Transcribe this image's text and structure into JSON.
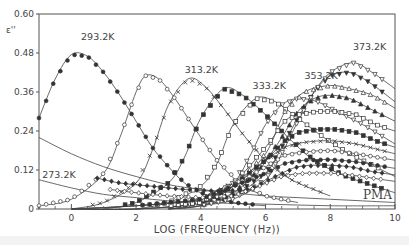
{
  "chart_data": {
    "type": "line",
    "title": "",
    "xlabel": "LOG (FREQUENCY (Hz))",
    "ylabel": "ε''",
    "xlim": [
      -1,
      10
    ],
    "ylim": [
      0,
      0.6
    ],
    "xticks": [
      0,
      2,
      4,
      6,
      8,
      10
    ],
    "xtick_labels": [
      "0",
      "2",
      "4",
      "6",
      "8",
      "10"
    ],
    "yticks": [
      0,
      0.12,
      0.24,
      0.36,
      0.48,
      0.6
    ],
    "ytick_labels": [
      "0",
      "0.12",
      "0.24",
      "0.36",
      "0.48",
      "0.60"
    ],
    "grid": false,
    "legend": "none",
    "annotation_pma": "PMA",
    "curve_labels": [
      {
        "text": "293.2K",
        "x": 0.3,
        "y": 0.52
      },
      {
        "text": "313.2K",
        "x": 3.5,
        "y": 0.42
      },
      {
        "text": "333.2K",
        "x": 5.6,
        "y": 0.37
      },
      {
        "text": "353.2K",
        "x": 7.2,
        "y": 0.4
      },
      {
        "text": "373.2K",
        "x": 8.7,
        "y": 0.49
      },
      {
        "text": "273.2K",
        "x": -0.9,
        "y": 0.095
      }
    ],
    "series": [
      {
        "name": "273.2K",
        "marker": "none",
        "x": [
          -1,
          0,
          1,
          2,
          3,
          4,
          5,
          6,
          7,
          8,
          9,
          10
        ],
        "y": [
          0.22,
          0.17,
          0.13,
          0.1,
          0.075,
          0.06,
          0.05,
          0.04,
          0.035,
          0.03,
          0.025,
          0.02
        ]
      },
      {
        "name": "273.2K-b",
        "marker": "none",
        "x": [
          -1,
          0,
          1,
          2,
          3,
          4,
          6,
          8,
          10
        ],
        "y": [
          0.09,
          0.065,
          0.045,
          0.035,
          0.025,
          0.02,
          0.015,
          0.01,
          0.01
        ]
      },
      {
        "name": "293.2K",
        "marker": "filled-circle",
        "x": [
          -1,
          -0.5,
          0,
          0.5,
          1,
          1.5,
          2,
          2.5,
          3,
          3.5,
          4,
          5,
          6
        ],
        "y": [
          0.28,
          0.4,
          0.475,
          0.47,
          0.42,
          0.35,
          0.27,
          0.19,
          0.13,
          0.08,
          0.05,
          0.02,
          0.01
        ]
      },
      {
        "name": "303.2K",
        "marker": "open-circle-dot",
        "x": [
          -1,
          0,
          1,
          1.5,
          2,
          2.3,
          2.7,
          3.2,
          3.8,
          4.5,
          5.2,
          6,
          7
        ],
        "y": [
          0.01,
          0.03,
          0.11,
          0.22,
          0.36,
          0.41,
          0.4,
          0.34,
          0.25,
          0.15,
          0.08,
          0.04,
          0.02
        ]
      },
      {
        "name": "313.2K",
        "marker": "open-x",
        "x": [
          0,
          1,
          2,
          2.5,
          3,
          3.6,
          4.1,
          4.7,
          5.3,
          6,
          6.8,
          8
        ],
        "y": [
          0.0,
          0.02,
          0.08,
          0.18,
          0.32,
          0.4,
          0.38,
          0.31,
          0.23,
          0.15,
          0.09,
          0.04
        ]
      },
      {
        "name": "323.2K",
        "marker": "filled-square",
        "x": [
          1,
          2,
          3,
          3.5,
          4,
          4.7,
          5.3,
          6,
          6.8,
          7.5,
          8.5,
          10
        ],
        "y": [
          0.0,
          0.02,
          0.08,
          0.16,
          0.28,
          0.37,
          0.35,
          0.29,
          0.21,
          0.15,
          0.1,
          0.05
        ]
      },
      {
        "name": "333.2K",
        "marker": "open-square",
        "x": [
          2,
          3,
          4,
          4.5,
          5,
          5.7,
          6.3,
          7,
          7.8,
          8.6,
          10
        ],
        "y": [
          0.0,
          0.02,
          0.07,
          0.14,
          0.26,
          0.34,
          0.33,
          0.28,
          0.22,
          0.17,
          0.1
        ]
      },
      {
        "name": "343.2K",
        "marker": "open-triangle-down",
        "x": [
          3,
          4,
          5,
          5.5,
          6,
          6.5,
          7,
          7.6,
          8.2,
          9,
          10
        ],
        "y": [
          0.0,
          0.02,
          0.08,
          0.16,
          0.26,
          0.32,
          0.34,
          0.33,
          0.3,
          0.26,
          0.2
        ]
      },
      {
        "name": "353.2K",
        "marker": "filled-triangle-up",
        "x": [
          3,
          4,
          5,
          5.8,
          6.5,
          7,
          7.5,
          8,
          8.6,
          9.2,
          10
        ],
        "y": [
          0.0,
          0.01,
          0.05,
          0.12,
          0.22,
          0.3,
          0.34,
          0.35,
          0.34,
          0.31,
          0.27
        ]
      },
      {
        "name": "363.2K",
        "marker": "filled-triangle-down",
        "x": [
          3,
          4,
          5,
          6,
          6.5,
          7,
          7.5,
          8,
          8.6,
          9.2,
          10
        ],
        "y": [
          0.0,
          0.01,
          0.04,
          0.11,
          0.19,
          0.28,
          0.36,
          0.41,
          0.42,
          0.39,
          0.33
        ]
      },
      {
        "name": "373.2K",
        "marker": "open-triangle-down",
        "x": [
          3,
          4,
          5,
          6,
          6.5,
          7,
          7.5,
          8,
          8.7,
          9.3,
          10
        ],
        "y": [
          0.0,
          0.01,
          0.03,
          0.09,
          0.17,
          0.27,
          0.36,
          0.42,
          0.45,
          0.42,
          0.37
        ]
      },
      {
        "name": "series-open-triangle-up",
        "marker": "open-triangle-up",
        "x": [
          0,
          2,
          4,
          5,
          6,
          6.6,
          7.2,
          8,
          8.6,
          9.3,
          10
        ],
        "y": [
          0.0,
          0.0,
          0.02,
          0.07,
          0.17,
          0.3,
          0.36,
          0.38,
          0.37,
          0.35,
          0.31
        ]
      },
      {
        "name": "series-filled-square-2",
        "marker": "filled-square",
        "x": [
          0,
          2,
          4,
          5,
          6,
          6.6,
          7,
          7.6,
          8.2,
          8.8,
          9.4,
          10
        ],
        "y": [
          0.0,
          0.0,
          0.02,
          0.07,
          0.15,
          0.21,
          0.235,
          0.245,
          0.245,
          0.235,
          0.21,
          0.19
        ]
      },
      {
        "name": "series-open-square-2",
        "marker": "open-square",
        "x": [
          0,
          2,
          4,
          5,
          6,
          6.6,
          7,
          7.6,
          8.2,
          8.8,
          9.4,
          10
        ],
        "y": [
          0.0,
          0.0,
          0.02,
          0.08,
          0.19,
          0.27,
          0.29,
          0.3,
          0.3,
          0.29,
          0.26,
          0.24
        ]
      },
      {
        "name": "series-x",
        "marker": "x",
        "x": [
          0,
          2,
          4,
          5,
          6,
          6.6,
          7.2,
          8,
          8.8,
          9.4,
          10
        ],
        "y": [
          0.0,
          0.01,
          0.03,
          0.08,
          0.15,
          0.19,
          0.205,
          0.21,
          0.2,
          0.185,
          0.17
        ]
      },
      {
        "name": "series-open-circle",
        "marker": "open-circle",
        "x": [
          0,
          2,
          4,
          5,
          6,
          6.6,
          7.2,
          8,
          8.8,
          9.4,
          10
        ],
        "y": [
          0.0,
          0.01,
          0.03,
          0.07,
          0.13,
          0.165,
          0.175,
          0.18,
          0.17,
          0.16,
          0.15
        ]
      },
      {
        "name": "series-filled-circle-2",
        "marker": "filled-circle",
        "x": [
          0,
          2,
          4,
          5,
          6,
          6.6,
          7.2,
          8,
          8.8,
          9.4,
          10
        ],
        "y": [
          0.0,
          0.01,
          0.03,
          0.07,
          0.11,
          0.14,
          0.15,
          0.152,
          0.145,
          0.135,
          0.125
        ]
      },
      {
        "name": "series-filled-diamond",
        "marker": "filled-diamond",
        "x": [
          0.8,
          1.5,
          2.5,
          3.5,
          4.5,
          5.5,
          6.3,
          7,
          7.8,
          8.6,
          9.3,
          10
        ],
        "y": [
          0.095,
          0.08,
          0.07,
          0.06,
          0.055,
          0.06,
          0.1,
          0.13,
          0.135,
          0.13,
          0.115,
          0.105
        ]
      },
      {
        "name": "series-open-diamond",
        "marker": "open-diamond",
        "x": [
          1.2,
          2,
          3,
          4,
          5,
          5.8,
          6.5,
          7.2,
          8,
          8.6,
          9.3,
          10
        ],
        "y": [
          0.06,
          0.05,
          0.04,
          0.035,
          0.04,
          0.07,
          0.1,
          0.11,
          0.11,
          0.105,
          0.095,
          0.085
        ]
      }
    ]
  }
}
